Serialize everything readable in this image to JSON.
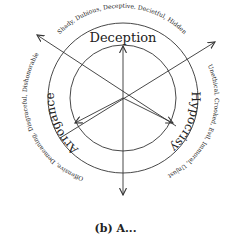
{
  "diagram": {
    "center": {
      "x": 123,
      "y": 98
    },
    "inner_radius": 53,
    "outer_radius": 75,
    "line_color": "#333333",
    "sectors": [
      {
        "name": "Deception",
        "outer_terms": "Shady, Dubious, Deceptive, Decietful, Hidden"
      },
      {
        "name": "Hypocrisy",
        "outer_terms": "Unethical, Crooked, Evil, Immoral, Unjust"
      },
      {
        "name": "Arrogance",
        "outer_terms": "Offensive, Demeaning, Disgraceful, Dishonorable"
      }
    ],
    "arrows": [
      {
        "from": [
          123,
          195
        ],
        "to": [
          123,
          46
        ],
        "direction": "up"
      },
      {
        "from": [
          123,
          98
        ],
        "to": [
          123,
          195
        ],
        "direction": "down"
      },
      {
        "from": [
          176,
          126
        ],
        "to": [
          37,
          35
        ],
        "direction": "upper-left"
      },
      {
        "from": [
          60,
          138
        ],
        "to": [
          215,
          42
        ],
        "direction": "upper-right"
      },
      {
        "from": [
          123,
          98
        ],
        "to": [
          75,
          123
        ],
        "direction": "lower-left"
      },
      {
        "from": [
          123,
          98
        ],
        "to": [
          173,
          123
        ],
        "direction": "lower-right"
      }
    ]
  },
  "caption": "(b) A..."
}
